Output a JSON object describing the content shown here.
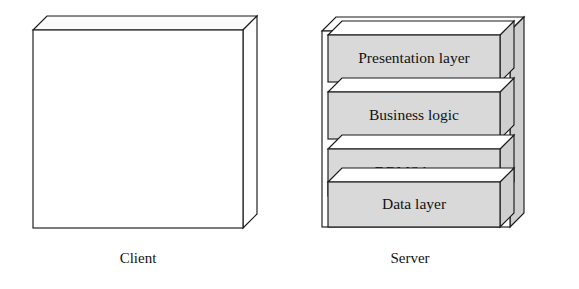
{
  "diagram": {
    "type": "isometric-block-diagram",
    "background_color": "#ffffff",
    "line_color": "#1b1b1b",
    "layer_fill_color": "#d9d9d9",
    "client_fill_color": "#ffffff"
  },
  "client": {
    "caption": "Client",
    "layers": []
  },
  "server": {
    "caption": "Server",
    "layers": [
      {
        "label": "Presentation layer"
      },
      {
        "label": "Business logic"
      },
      {
        "label": "DBMS layer"
      },
      {
        "label": "Data layer"
      }
    ]
  }
}
